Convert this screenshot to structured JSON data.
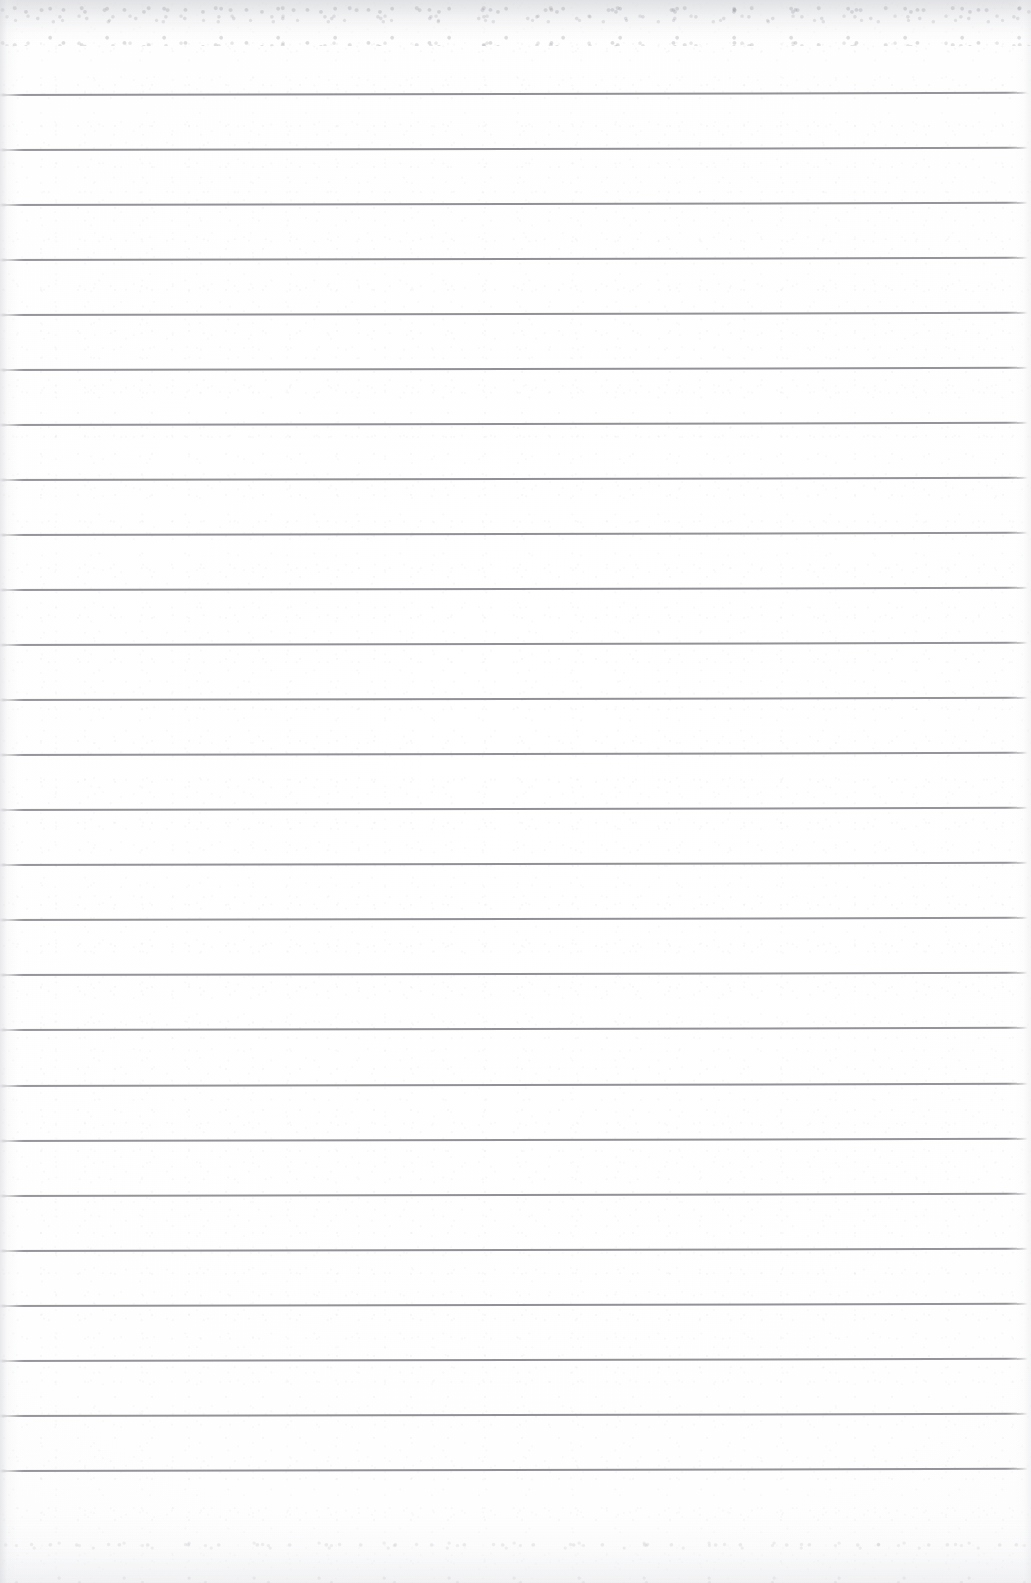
{
  "document": {
    "type": "scanned-ruled-paper",
    "title": "Blank lined notebook page",
    "page_width": 1031,
    "page_height": 1583,
    "content_text": "",
    "has_handwriting": false,
    "has_printed_text": false
  },
  "colors": {
    "paper": "#ffffff",
    "paper_shade": "#fbfbfc",
    "rule_line": "#8c8c91",
    "rule_line_faded": "#9a9a9e",
    "scan_noise": "#d8d9dd"
  },
  "ruling": {
    "line_count": 26,
    "first_line_y": 94,
    "line_spacing": 55.04,
    "line_thickness": 2,
    "line_left_x": 2,
    "line_right_x": 1028,
    "tilt_degrees": -0.12,
    "top_margin_height": 94,
    "bottom_margin_height": 113,
    "line_y_positions": [
      94,
      149,
      204,
      259,
      314,
      369,
      424,
      479,
      534,
      589,
      644,
      699,
      754,
      809,
      864,
      919,
      974,
      1029,
      1085,
      1140,
      1195,
      1250,
      1305,
      1360,
      1415,
      1470
    ]
  },
  "regions": {
    "top_margin_label": "",
    "bottom_margin_label": "",
    "left_edge_label": "",
    "right_edge_label": ""
  }
}
